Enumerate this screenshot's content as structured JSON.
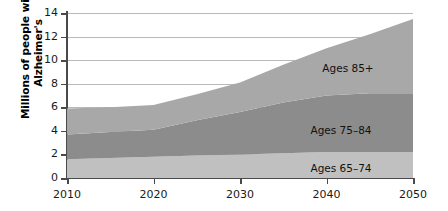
{
  "chart_data": {
    "type": "area",
    "title": "",
    "subtitle": "",
    "xlabel": "",
    "ylabel": "Millions of people with Alzheimer's",
    "ylabel_line1": "Millions of people with",
    "ylabel_line2": "Alzheimer's",
    "xlim": [
      2010,
      2050
    ],
    "ylim": [
      0,
      14
    ],
    "ytick_labels": [
      "0",
      "2",
      "4",
      "6",
      "8",
      "10",
      "12",
      "14"
    ],
    "ytick_values": [
      0,
      2,
      4,
      6,
      8,
      10,
      12,
      14
    ],
    "xtick_labels": [
      "2010",
      "2020",
      "2030",
      "2040",
      "2050"
    ],
    "xtick_values": [
      2010,
      2020,
      2030,
      2040,
      2050
    ],
    "grid": "horizontal",
    "legend_position": "inline-annotations",
    "stacked": true,
    "x": [
      2010,
      2015,
      2020,
      2025,
      2030,
      2035,
      2040,
      2045,
      2050
    ],
    "series": [
      {
        "name": "Ages 65–74",
        "color": "#c0c0c0",
        "values": [
          1.6,
          1.7,
          1.8,
          1.9,
          2.0,
          2.1,
          2.2,
          2.2,
          2.2
        ]
      },
      {
        "name": "Ages 75–84",
        "color": "#8c8c8c",
        "values": [
          2.1,
          2.2,
          2.3,
          3.0,
          3.6,
          4.3,
          4.8,
          5.0,
          5.0
        ]
      },
      {
        "name": "Ages 85+",
        "color": "#a8a8a8",
        "values": [
          2.2,
          2.1,
          2.1,
          2.2,
          2.5,
          3.2,
          4.0,
          5.0,
          6.3
        ]
      }
    ],
    "cumulative_totals": [
      5.9,
      6.0,
      6.2,
      7.1,
      8.1,
      9.6,
      11.0,
      12.2,
      13.5
    ],
    "annotations": [
      {
        "name": "Ages 85+",
        "text": "Ages 85+",
        "x_px": 348,
        "y_px": 62
      },
      {
        "name": "Ages 75-84",
        "text": "Ages 75–84",
        "x_px": 341,
        "y_px": 124
      },
      {
        "name": "Ages 65-74",
        "text": "Ages 65–74",
        "x_px": 341,
        "y_px": 162
      }
    ]
  },
  "colors": {
    "axis": "#4a4a4a",
    "grid": "#b9b9b9",
    "text": "#1a1a1a",
    "background": "#ffffff"
  }
}
